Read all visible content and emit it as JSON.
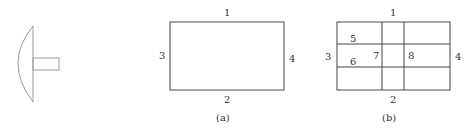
{
  "figure_a": {
    "caption": "(a)",
    "edge_labels": {
      "top": "1",
      "bottom": "2",
      "left": "3",
      "right": "4"
    }
  },
  "figure_b": {
    "caption": "(b)",
    "edge_labels": {
      "top": "1",
      "bottom": "2",
      "left": "3",
      "right": "4"
    },
    "inner_labels": [
      "5",
      "6",
      "7",
      "8"
    ]
  },
  "colors": {
    "stroke": "#444444",
    "stroke_light": "#999999"
  }
}
